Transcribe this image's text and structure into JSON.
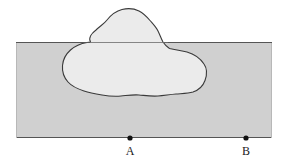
{
  "figure": {
    "name": "cross-section-with-anomalous-body",
    "type": "geologic-cross-section-diagram",
    "background_color": "#ffffff"
  },
  "layer_band": {
    "name": "horizontal-stratum-band",
    "fill_color": "#d0d0d0",
    "stroke_color": "#4d4d4d",
    "x": 16,
    "y": 42,
    "width": 256,
    "height": 96
  },
  "body_outline": {
    "name": "irregular-intrusion-outline",
    "fill_color": "#ebebeb",
    "stroke_color": "#3a3a3a",
    "stroke_width": 1,
    "description": "closed irregular blob straddling the top boundary of the band",
    "path": "M 90.5 42 C 88 38 92 33 96 30 C 100 26 104 24 107 20 C 111 15 116 11 122 9.5 C 128 8 134 8.5 139 11 C 144 13.5 147 17 150 20.5 C 153 24 156 27 158 31 C 160 35 161 38.5 163 42 C 165 45 167 47 169.5 48.5 C 175 50 181 50.5 187 52 C 194 54 200 58 204 64 C 207.5 69 207 75 205 80.5 C 203 86 199 90 193 92 C 188 93.5 182 93.5 176 94 C 170 94.5 164 95.5 158 96 C 151 96.5 145 95.5 139 95 C 133 94.5 127 95.5 121 96 C 114 96.5 108 96 102 95 C 96 94 90 93 84 91 C 78 89 72 86.5 68 82 C 64 77.5 62 71.5 62.5 65.5 C 63 59.5 66 54 70.5 50 C 75 46 81 43.5 87 42.5 Z"
  },
  "band_top_line": {
    "name": "band-top-boundary",
    "y": 42,
    "x_start": 16,
    "x_end": 272
  },
  "band_bottom_line": {
    "name": "band-bottom-boundary",
    "y": 138,
    "x_start": 16,
    "x_end": 272
  },
  "points": [
    {
      "name": "point-a",
      "label": "A",
      "x": 130,
      "y": 138,
      "radius": 2.6,
      "color": "#111111"
    },
    {
      "name": "point-b",
      "label": "B",
      "x": 246,
      "y": 138,
      "radius": 2.6,
      "color": "#111111"
    }
  ],
  "labels": {
    "a": "A",
    "b": "B"
  }
}
